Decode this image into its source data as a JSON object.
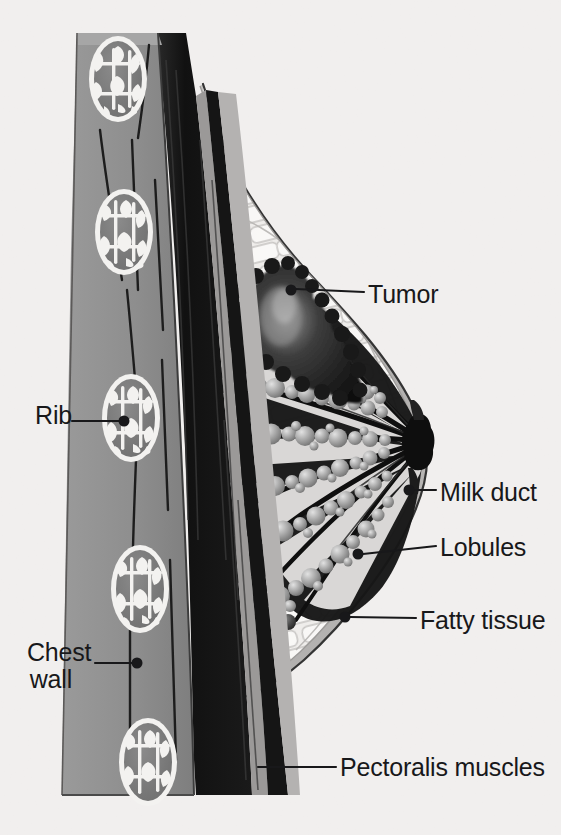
{
  "figure": {
    "kind": "medical-illustration",
    "background_color": "#f1efee",
    "ink_color": "#18181a",
    "palette": {
      "background": "#f1efee",
      "chest_wall_gray": "#8e8e8e",
      "pectoralis_black": "#141414",
      "rib_cortex_white": "#f4f3f1",
      "rib_trabecula_gray": "#7c7c7c",
      "skin_line": "#3a3a3a",
      "fatty_tissue_light": "#eeecea",
      "fatty_tissue_cell": "#f8f7f6",
      "fatty_septa_gray": "#b9b7b5",
      "breast_rim_gray": "#b0aeac",
      "duct_black": "#111111",
      "lobule_gray": "#9a9a9a",
      "lobule_highlight": "#d9d9d9",
      "tumor_dark": "#1b1b1b",
      "nipple_black": "#0e0e0e",
      "label_text": "#18181a",
      "leader_line": "#18181a"
    }
  },
  "labels": [
    {
      "id": "tumor",
      "text": "Tumor",
      "side": "right",
      "text_x": 368,
      "text_y": 281,
      "dot": {
        "x": 291,
        "y": 290,
        "r": 5.5
      },
      "leader": {
        "x1": 296,
        "y1": 289,
        "x2": 364,
        "y2": 292
      }
    },
    {
      "id": "milk-duct",
      "text": "Milk duct",
      "side": "right",
      "text_x": 440,
      "text_y": 479,
      "dot": {
        "x": 409,
        "y": 490,
        "r": 5.5
      },
      "leader": {
        "x1": 414,
        "y1": 490,
        "x2": 436,
        "y2": 490
      }
    },
    {
      "id": "lobules",
      "text": "Lobules",
      "side": "right",
      "text_x": 440,
      "text_y": 534,
      "dot": {
        "x": 358,
        "y": 554,
        "r": 5.5
      },
      "leader": {
        "x1": 363,
        "y1": 554,
        "x2": 436,
        "y2": 546
      }
    },
    {
      "id": "fatty-tissue",
      "text": "Fatty tissue",
      "side": "right",
      "text_x": 420,
      "text_y": 607,
      "dot": {
        "x": 345,
        "y": 617,
        "r": 5.5
      },
      "leader": {
        "x1": 350,
        "y1": 617,
        "x2": 416,
        "y2": 618
      }
    },
    {
      "id": "pectoralis-muscles",
      "text": "Pectoralis muscles",
      "side": "right",
      "text_x": 340,
      "text_y": 754,
      "dot": null,
      "leader": {
        "x1": 258,
        "y1": 767,
        "x2": 336,
        "y2": 767
      }
    },
    {
      "id": "rib",
      "text": "Rib",
      "side": "left",
      "text_x": 27,
      "text_y": 402,
      "dot": {
        "x": 124,
        "y": 421,
        "r": 5.5
      },
      "leader": {
        "x1": 72,
        "y1": 421,
        "x2": 119,
        "y2": 421
      }
    },
    {
      "id": "chest-wall",
      "text": "Chest\nwall",
      "side": "left",
      "text_x": 27,
      "text_y": 639,
      "dot": {
        "x": 137,
        "y": 663,
        "r": 5.5
      },
      "leader": {
        "x1": 95,
        "y1": 663,
        "x2": 132,
        "y2": 663
      }
    }
  ],
  "structures": {
    "chest_wall": {
      "name": "Chest wall",
      "description": "Vertical gray slab along the left of the figure with embedded ribs"
    },
    "ribs": {
      "name": "Rib",
      "count": 5,
      "description": "Oval bone cross-sections with white cortex and gray trabecular bone"
    },
    "pectoralis": {
      "name": "Pectoralis muscles",
      "description": "Black fibrous muscle bands between chest wall and breast tissue"
    },
    "fatty_tissue": {
      "name": "Fatty tissue",
      "description": "Pale honeycomb lobular fat filling the breast"
    },
    "lobules": {
      "name": "Lobules",
      "description": "Grape-like clusters of gray spheres at the ends of the ducts"
    },
    "milk_duct": {
      "name": "Milk duct",
      "description": "Black ducts radiating from the lobules and converging at the nipple"
    },
    "nipple": {
      "name": "Nipple",
      "description": "Dark knot at the apex of the breast where ducts converge"
    },
    "tumor": {
      "name": "Tumor",
      "description": "Irregular dark mass in the upper breast invading glandular tissue"
    }
  }
}
